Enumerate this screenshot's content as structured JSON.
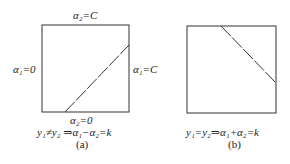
{
  "diagram": {
    "panel_a": {
      "top_label": "α₂=C",
      "left_label": "α₁=0",
      "right_label": "α₁=C",
      "bottom_label": "α₂=0",
      "equation": "y₁≠y₂ ⇒α₁−α₂=k",
      "caption": "(a)",
      "box": {
        "x": 42,
        "y": 25,
        "w": 87,
        "h": 87
      },
      "line": {
        "x1": 65,
        "y1": 112,
        "x2": 129,
        "y2": 45,
        "style": "dashed"
      }
    },
    "panel_b": {
      "equation": "y₁=y₂⇒α₁+α₂=k",
      "caption": "(b)",
      "box": {
        "x": 187,
        "y": 26,
        "w": 89,
        "h": 87
      },
      "line": {
        "x1": 221,
        "y1": 26,
        "x2": 276,
        "y2": 83,
        "style": "dashed"
      }
    },
    "colors": {
      "stroke": "#333333",
      "text": "#222222"
    }
  }
}
